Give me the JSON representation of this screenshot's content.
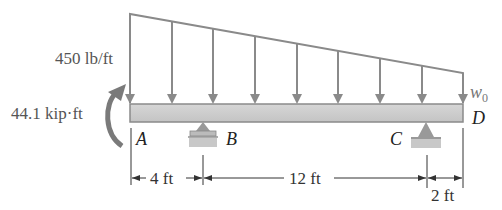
{
  "diagram": {
    "type": "beam-loading",
    "load": {
      "kind": "linearly-varying distributed load",
      "left_label": "450 lb/ft",
      "right_label": "w",
      "right_label_sub": "0",
      "arrow_count": 9
    },
    "moment": {
      "label": "44.1 kip·ft",
      "direction": "counterclockwise"
    },
    "points": {
      "A": "A",
      "B": "B",
      "C": "C",
      "D": "D"
    },
    "supports": [
      {
        "point": "B",
        "kind": "roller"
      },
      {
        "point": "C",
        "kind": "pin"
      }
    ],
    "dimensions": [
      {
        "from": "A",
        "to": "B",
        "label": "4 ft"
      },
      {
        "from": "B",
        "to": "C",
        "label": "12 ft"
      },
      {
        "from": "C",
        "to": "D",
        "label": "2 ft"
      }
    ],
    "colors": {
      "line": "#8a8a8a",
      "beam_fill": "#cfcfcf",
      "moment_arrow": "#7a7a7a",
      "label_gray": "#666666"
    }
  }
}
